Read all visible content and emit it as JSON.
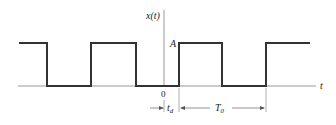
{
  "diagram": {
    "type": "periodic-rectangular-pulse-train",
    "y_axis_label": "x(t)",
    "x_axis_label": "t",
    "amplitude_label": "A",
    "origin_label": "0",
    "delay_label": "t",
    "delay_subscript": "d",
    "period_label": "T",
    "period_subscript": "0",
    "colors": {
      "signal": "#333333",
      "axis": "#888888",
      "text": "#222222"
    }
  }
}
